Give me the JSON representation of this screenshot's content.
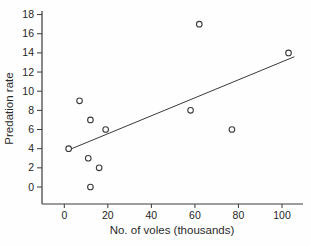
{
  "figure": {
    "background": "#fefefe",
    "ink_color": "#3a3a3a",
    "text_color": "#262626"
  },
  "chart_data": {
    "type": "scatter",
    "title": "",
    "xlabel": "No. of voles (thousands)",
    "ylabel": "Predation rate",
    "xlim": [
      0,
      100
    ],
    "ylim": [
      0,
      18
    ],
    "xticks": [
      0,
      20,
      40,
      60,
      80,
      100
    ],
    "yticks": [
      0,
      2,
      4,
      6,
      8,
      10,
      12,
      14,
      16,
      18
    ],
    "grid": false,
    "legend": "none",
    "marker": "open-circle",
    "points": [
      {
        "x": 2,
        "y": 4
      },
      {
        "x": 7,
        "y": 9
      },
      {
        "x": 11,
        "y": 3
      },
      {
        "x": 12,
        "y": 0
      },
      {
        "x": 12,
        "y": 7
      },
      {
        "x": 16,
        "y": 2
      },
      {
        "x": 19,
        "y": 6
      },
      {
        "x": 58,
        "y": 8
      },
      {
        "x": 62,
        "y": 17
      },
      {
        "x": 77,
        "y": 6
      },
      {
        "x": 103,
        "y": 14
      }
    ],
    "trendline": {
      "x1": 3.4,
      "y1": 4.0,
      "x2": 105.7,
      "y2": 13.6
    }
  }
}
